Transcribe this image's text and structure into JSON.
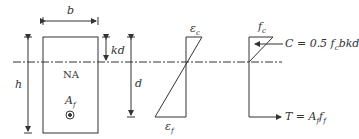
{
  "figure": {
    "type": "reinforced-section-strain-stress-diagram",
    "labels": {
      "width": "b",
      "height": "h",
      "neutral_axis_depth": "kd",
      "effective_depth": "d",
      "neutral_axis": "NA",
      "reinforcement_area": "A",
      "reinforcement_area_sub": "f",
      "concrete_strain": "ε",
      "concrete_strain_sub": "c",
      "frp_strain": "ε",
      "frp_strain_sub": "f",
      "concrete_stress": "f",
      "concrete_stress_sub": "c",
      "compression_force": "C = 0.5 f",
      "compression_force_sub": "c",
      "compression_force_tail": "bkd",
      "tension_force": "T = A",
      "tension_force_sub1": "f",
      "tension_force_mid": "f",
      "tension_force_sub2": "f"
    },
    "colors": {
      "line": "#333333",
      "background": "#ffffff"
    }
  }
}
